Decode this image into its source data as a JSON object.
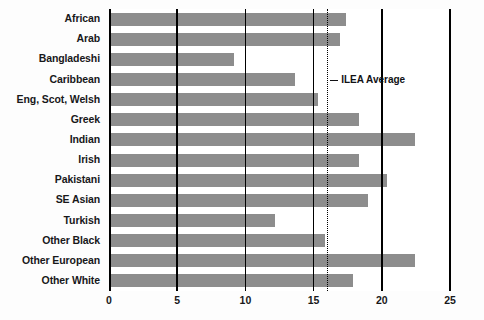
{
  "chart_data": {
    "type": "bar",
    "orientation": "horizontal",
    "title": "",
    "subtitle": "",
    "xlabel": "",
    "ylabel": "",
    "categories": [
      "African",
      "Arab",
      "Bangladeshi",
      "Caribbean",
      "Eng, Scot, Welsh",
      "Greek",
      "Indian",
      "Irish",
      "Pakistani",
      "SE Asian",
      "Turkish",
      "Other Black",
      "Other European",
      "Other White"
    ],
    "values": [
      17.4,
      16.9,
      9.2,
      13.6,
      15.3,
      18.3,
      22.4,
      18.3,
      20.4,
      19.0,
      12.2,
      15.8,
      22.4,
      17.9
    ],
    "xlim": [
      0,
      25
    ],
    "xticks": [
      0,
      5,
      10,
      15,
      20,
      25
    ],
    "xtick_labels": [
      "0",
      "5",
      "10",
      "15",
      "20",
      "25"
    ],
    "grid": true,
    "gridlines_x": [
      0,
      5,
      10,
      15,
      20,
      25
    ],
    "legend": null,
    "annotations": [
      {
        "label": "ILEA Average",
        "value": 16.0,
        "line_style": "dotted"
      }
    ],
    "colors": {
      "bar_fill": "#8d8d8d",
      "gridline": "#000000",
      "text": "#18181a",
      "background": "#ffffff"
    }
  }
}
